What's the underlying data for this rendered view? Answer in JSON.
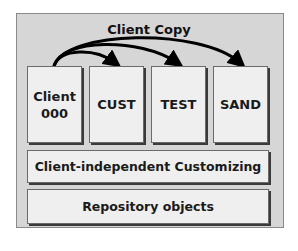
{
  "diagram": {
    "title": "Client Copy",
    "clients": [
      {
        "label_line1": "Client",
        "label_line2": "000"
      },
      {
        "label": "CUST"
      },
      {
        "label": "TEST"
      },
      {
        "label": "SAND"
      }
    ],
    "layers": [
      {
        "label": "Client-independent Customizing"
      },
      {
        "label": "Repository objects"
      }
    ],
    "arrows": [
      {
        "from": "Client 000",
        "to": "CUST"
      },
      {
        "from": "Client 000",
        "to": "TEST"
      },
      {
        "from": "Client 000",
        "to": "SAND"
      }
    ],
    "colors": {
      "frame_bg": "#d6d6d6",
      "box_bg": "#efefef",
      "arrow": "#000000"
    }
  }
}
